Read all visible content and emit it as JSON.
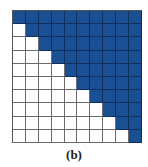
{
  "figure": {
    "caption": "(b)",
    "rows": 10,
    "cols": 10,
    "fill_rule": "upper-triangle-including-diagonal",
    "colors": {
      "filled": "#1b4f94",
      "empty": "#ffffff",
      "grid": "#6b6b6b"
    },
    "cells": [
      [
        1,
        1,
        1,
        1,
        1,
        1,
        1,
        1,
        1,
        1
      ],
      [
        0,
        1,
        1,
        1,
        1,
        1,
        1,
        1,
        1,
        1
      ],
      [
        0,
        0,
        1,
        1,
        1,
        1,
        1,
        1,
        1,
        1
      ],
      [
        0,
        0,
        0,
        1,
        1,
        1,
        1,
        1,
        1,
        1
      ],
      [
        0,
        0,
        0,
        0,
        1,
        1,
        1,
        1,
        1,
        1
      ],
      [
        0,
        0,
        0,
        0,
        0,
        1,
        1,
        1,
        1,
        1
      ],
      [
        0,
        0,
        0,
        0,
        0,
        0,
        1,
        1,
        1,
        1
      ],
      [
        0,
        0,
        0,
        0,
        0,
        0,
        0,
        1,
        1,
        1
      ],
      [
        0,
        0,
        0,
        0,
        0,
        0,
        0,
        0,
        1,
        1
      ],
      [
        0,
        0,
        0,
        0,
        0,
        0,
        0,
        0,
        0,
        1
      ]
    ]
  }
}
